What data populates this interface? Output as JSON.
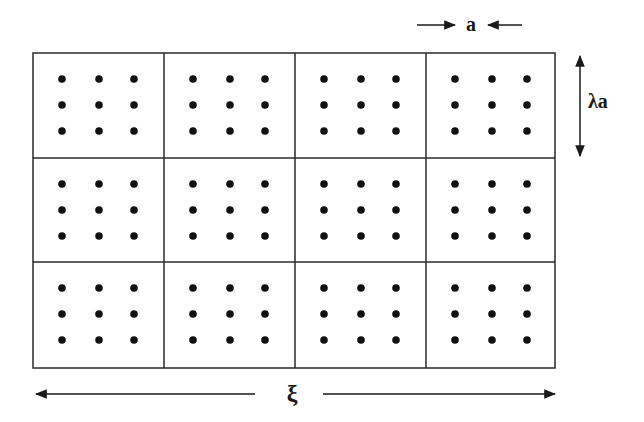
{
  "diagram": {
    "grid": {
      "rows": 3,
      "cols": 4,
      "dots_per_block": [
        3,
        3
      ]
    },
    "labels": {
      "spacing": "a",
      "block_height": "λa",
      "total_width": "ξ"
    },
    "colors": {
      "line": "#2a2a2a",
      "dot": "#111111",
      "background": "#ffffff"
    }
  }
}
